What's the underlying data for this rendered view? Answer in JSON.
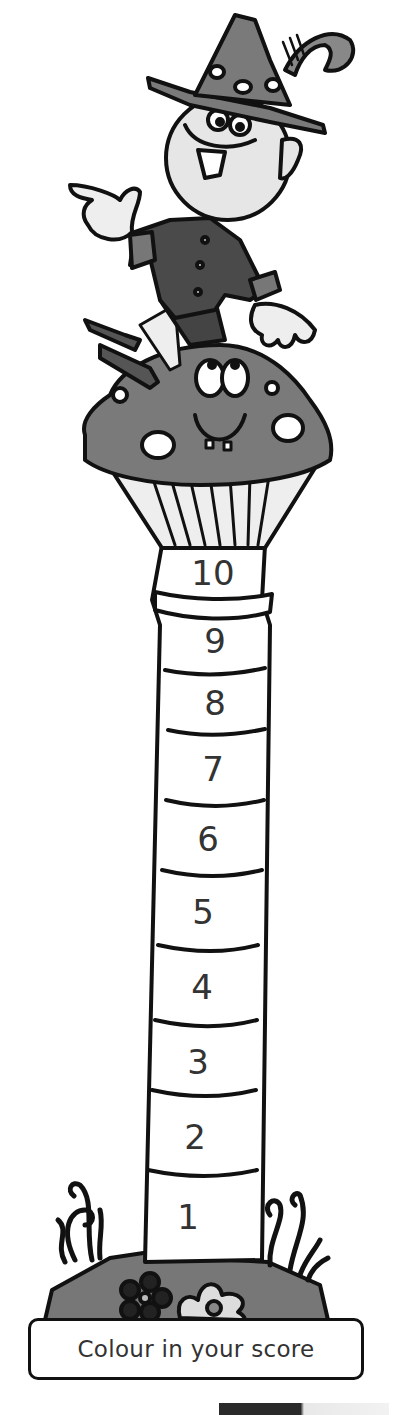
{
  "page": {
    "title": "Colour in your score",
    "caption": "Colour in your score"
  },
  "illustration": {
    "character": "elf-on-mushroom",
    "colors": {
      "hat": "#7a7a7a",
      "jacket": "#4a4a4a",
      "skin": "#e6e6e6",
      "mushroom_cap": "#7a7a7a",
      "ground": "#777777",
      "outline": "#111111",
      "segment_fill": "#ffffff"
    }
  },
  "score_column": {
    "segments": [
      {
        "label": "10"
      },
      {
        "label": "9"
      },
      {
        "label": "8"
      },
      {
        "label": "7"
      },
      {
        "label": "6"
      },
      {
        "label": "5"
      },
      {
        "label": "4"
      },
      {
        "label": "3"
      },
      {
        "label": "2"
      },
      {
        "label": "1"
      }
    ]
  }
}
